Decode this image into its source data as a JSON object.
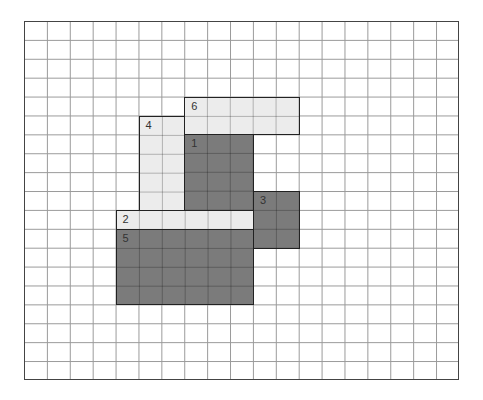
{
  "grid": {
    "cols": 19,
    "rows": 19,
    "left": 24,
    "top": 21,
    "cell_w": 22.9,
    "cell_h": 18.9
  },
  "colors": {
    "dark": "#7b7b7b",
    "light": "#ececec"
  },
  "shapes": [
    {
      "label": "6",
      "col": 7,
      "row": 4,
      "w": 5,
      "h": 2,
      "tone": "light"
    },
    {
      "label": "4",
      "col": 5,
      "row": 5,
      "w": 2,
      "h": 5,
      "tone": "light"
    },
    {
      "label": "1",
      "col": 7,
      "row": 6,
      "w": 3,
      "h": 4,
      "tone": "dark"
    },
    {
      "label": "3",
      "col": 10,
      "row": 9,
      "w": 2,
      "h": 3,
      "tone": "dark"
    },
    {
      "label": "2",
      "col": 4,
      "row": 10,
      "w": 6,
      "h": 1,
      "tone": "light"
    },
    {
      "label": "5",
      "col": 4,
      "row": 11,
      "w": 6,
      "h": 4,
      "tone": "dark"
    }
  ]
}
